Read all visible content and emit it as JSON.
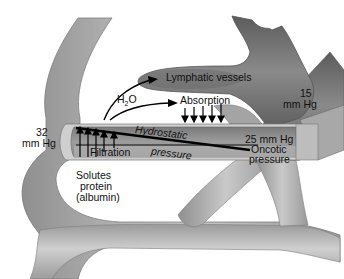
{
  "diagram": {
    "labels": {
      "lymphatic_vessels": "Lymphatic vessels",
      "h2o_main": "H",
      "h2o_sub": "2",
      "h2o_end": "O",
      "absorption": "Absorption",
      "pressure_15_value": "15",
      "pressure_15_unit": "mm Hg",
      "pressure_32_value": "32",
      "pressure_32_unit": "mm Hg",
      "hydrostatic": "Hydrostatic",
      "pressure_word": "pressure",
      "pressure_25": "25 mm Hg",
      "oncotic": "Oncotic",
      "oncotic_pressure": "pressure",
      "filtration": "Filtration",
      "solutes_line1": "Solutes",
      "solutes_line2": "protein",
      "solutes_line3": "(albumin)"
    },
    "arrows": {
      "filtration_count": 5,
      "absorption_count": 5
    },
    "colors": {
      "vessel_light": "#b9b9b9",
      "vessel_dark": "#6e6e6e",
      "lymph": "#7a7a7a",
      "text": "#111111",
      "background": "#ffffff"
    }
  }
}
